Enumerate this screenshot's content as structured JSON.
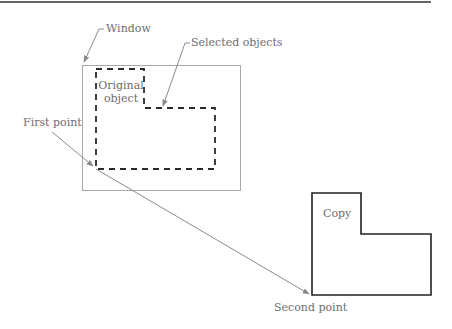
{
  "figure": {
    "labels": {
      "window": "Window",
      "selected_objects": "Selected objects",
      "first_point": "First point",
      "second_point": "Second point",
      "original_line1": "Original",
      "original_line2": "object",
      "copy": "Copy"
    },
    "colors": {
      "background": "#ffffff",
      "rule": "#333333",
      "window_outline": "#a8a8a8",
      "dashed_outline": "#2a2a2a",
      "copy_outline": "#222222",
      "leader": "#8a8a8a",
      "label_text": "#6e6e6e"
    }
  }
}
